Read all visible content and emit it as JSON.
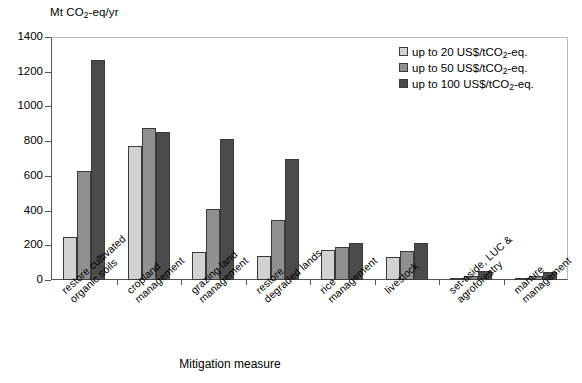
{
  "chart_data": {
    "type": "bar",
    "title": "",
    "ylabel": "Mt CO2-eq/yr",
    "ylabel_parts": {
      "pre": "Mt CO",
      "sub": "2",
      "post": "-eq/yr"
    },
    "xlabel": "Mitigation measure",
    "ylim": [
      0,
      1400
    ],
    "yticks": [
      0,
      200,
      400,
      600,
      800,
      1000,
      1200,
      1400
    ],
    "grid": false,
    "legend_position": "top-right",
    "categories": [
      "restore cultivated organic soils",
      "cropland management",
      "grazing land management",
      "restore degraded lands",
      "rice management",
      "livestock",
      "set-aside, LUC & agroforestry",
      "manure management"
    ],
    "category_lines": [
      [
        "restore cultivated",
        "organic soils"
      ],
      [
        "cropland",
        "management"
      ],
      [
        "grazing land",
        "management"
      ],
      [
        "restore",
        "degraded lands"
      ],
      [
        "rice",
        "management"
      ],
      [
        "livestock",
        ""
      ],
      [
        "set-aside, LUC &",
        "agroforestry"
      ],
      [
        "manure",
        "management"
      ]
    ],
    "series": [
      {
        "name": "up to 20 US$/tCO2-eq.",
        "name_parts": {
          "pre": "up to 20 US$/tCO",
          "sub": "2",
          "post": "-eq."
        },
        "color": "#d2d2d2",
        "values": [
          250,
          770,
          160,
          140,
          175,
          135,
          10,
          10
        ]
      },
      {
        "name": "up to 50 US$/tCO2-eq.",
        "name_parts": {
          "pre": "up to 50 US$/tCO",
          "sub": "2",
          "post": "-eq."
        },
        "color": "#909090",
        "values": [
          628,
          875,
          408,
          348,
          190,
          170,
          25,
          25
        ]
      },
      {
        "name": "up to 100 US$/tCO2-eq.",
        "name_parts": {
          "pre": "up to 100 US$/tCO",
          "sub": "2",
          "post": "-eq."
        },
        "color": "#4b4b4b",
        "values": [
          1268,
          855,
          815,
          695,
          215,
          215,
          50,
          48
        ]
      }
    ]
  }
}
